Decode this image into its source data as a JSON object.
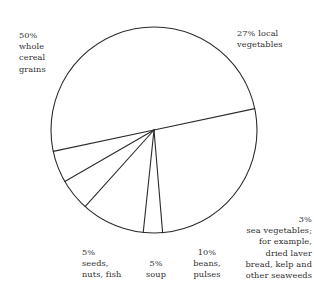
{
  "chart_data": {
    "type": "pie",
    "title": "",
    "subtitle": "",
    "xlabel": "",
    "ylabel": "",
    "legend_position": "none",
    "grid": false,
    "total": 100,
    "units": "percent",
    "start_angle_deg": -12,
    "direction": "clockwise",
    "categories": [
      "local vegetables",
      "sea vegetables; for example, dried laver bread, kelp and other seaweeds",
      "beans, pulses",
      "soup",
      "seeds, nuts, fish",
      "whole cereal grains"
    ],
    "values": [
      27,
      3,
      10,
      5,
      5,
      50
    ],
    "slices": [
      {
        "name": "local-vegetables",
        "percent": 27,
        "percent_label": "27%",
        "name_label": "local\nvegetables",
        "start_deg": -12,
        "end_deg": 85.2
      },
      {
        "name": "sea-vegetables",
        "percent": 3,
        "percent_label": "3%",
        "name_label": "sea vegetables;\nfor example,\ndried laver\nbread, kelp and\nother seaweeds",
        "start_deg": 85.2,
        "end_deg": 96.0
      },
      {
        "name": "beans-pulses",
        "percent": 10,
        "percent_label": "10%",
        "name_label": "beans,\npulses",
        "start_deg": 96.0,
        "end_deg": 132.0
      },
      {
        "name": "soup",
        "percent": 5,
        "percent_label": "5%",
        "name_label": "soup",
        "start_deg": 132.0,
        "end_deg": 150.0
      },
      {
        "name": "seeds-nuts-fish",
        "percent": 5,
        "percent_label": "5%",
        "name_label": "seeds,\nnuts, fish",
        "start_deg": 150.0,
        "end_deg": 168.0
      },
      {
        "name": "whole-cereal-grains",
        "percent": 50,
        "percent_label": "50%",
        "name_label": "whole\ncereal\ngrains",
        "start_deg": 168.0,
        "end_deg": 348.0
      }
    ],
    "geometry": {
      "center_x": 154,
      "center_y": 130,
      "radius": 103
    },
    "style": {
      "stroke_color": "#2b2b2b",
      "fill_color": "#ffffff",
      "background_color": "#ffffff",
      "text_color": "#2e2e2e",
      "stroke_width": 1
    }
  },
  "labels": {
    "cereal": "50%\nwhole\ncereal\ngrains",
    "vegetables": "27% local\nvegetables",
    "seaweed": "3%\nsea vegetables;\nfor example,\ndried laver\nbread, kelp and\nother seaweeds",
    "beans": "10%\nbeans,\npulses",
    "soup": "5%\nsoup",
    "seeds": "5%\nseeds,\nnuts, fish"
  }
}
